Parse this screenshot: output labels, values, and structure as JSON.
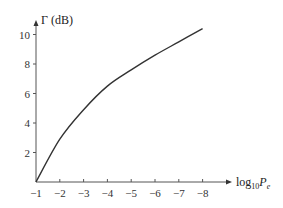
{
  "chart_data": {
    "type": "line",
    "title": "",
    "xlabel": "log10 Pe",
    "xlabel_parts": {
      "base": "log",
      "sub": "10",
      "var": "P",
      "var_sub": "e"
    },
    "ylabel": "Γ (dB)",
    "x": [
      -1,
      -2,
      -3,
      -4,
      -5,
      -6,
      -7,
      -8
    ],
    "x_ticks": [
      "−1",
      "−2",
      "−3",
      "−4",
      "−5",
      "−6",
      "−7",
      "−8"
    ],
    "y_ticks": [
      "2",
      "4",
      "6",
      "8",
      "10"
    ],
    "series": [
      {
        "name": "Γ",
        "values": [
          0,
          2.9,
          4.9,
          6.5,
          7.6,
          8.6,
          9.5,
          10.4
        ]
      }
    ],
    "xlim": [
      -1,
      -8
    ],
    "ylim": [
      0,
      10.5
    ],
    "grid": false,
    "legend": "none",
    "colors": {
      "line": "#333333",
      "axis": "#555555"
    }
  }
}
